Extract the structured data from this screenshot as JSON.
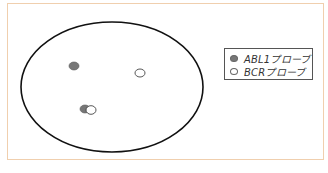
{
  "diagram": {
    "type": "FISH nucleus schematic",
    "frame_color": "#f0cfae",
    "nucleus": {
      "cx": 112,
      "cy": 87,
      "rx": 91,
      "ry": 65,
      "stroke": "#111"
    },
    "signals": [
      {
        "probe": "ABL1",
        "x": 74,
        "y": 66,
        "fill": "#777777"
      },
      {
        "probe": "BCR",
        "x": 140,
        "y": 73,
        "fill": "#ffffff"
      },
      {
        "probe": "ABL1",
        "x": 85,
        "y": 109,
        "fill": "#777777"
      },
      {
        "probe": "BCR",
        "x": 91,
        "y": 110,
        "fill": "#ffffff"
      }
    ],
    "legend": {
      "items": [
        {
          "label": "ABL1プローブ",
          "color": "#777777"
        },
        {
          "label": "BCRプローブ",
          "color": "#ffffff"
        }
      ]
    }
  }
}
